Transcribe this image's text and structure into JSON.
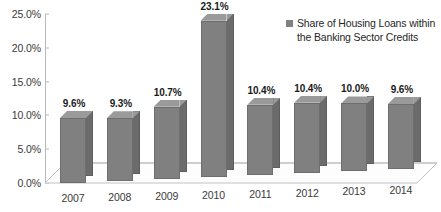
{
  "chart_data": {
    "type": "bar",
    "title": "",
    "xlabel": "",
    "ylabel": "",
    "categories": [
      "2007",
      "2008",
      "2009",
      "2010",
      "2011",
      "2012",
      "2013",
      "2014"
    ],
    "values": [
      9.6,
      9.3,
      10.7,
      23.1,
      10.4,
      10.4,
      10.0,
      9.6
    ],
    "value_labels": [
      "9.6%",
      "9.3%",
      "10.7%",
      "23.1%",
      "10.4%",
      "10.4%",
      "10.0%",
      "9.6%"
    ],
    "series": [
      {
        "name": "Share of Housing Loans within the Banking Sector Credits",
        "values": [
          9.6,
          9.3,
          10.7,
          23.1,
          10.4,
          10.4,
          10.0,
          9.6
        ],
        "color": "#808080"
      }
    ],
    "ylim": [
      0,
      25
    ],
    "ytick_values": [
      0,
      5,
      10,
      15,
      20,
      25
    ],
    "ytick_labels": [
      "0.0%",
      "5.0%",
      "10.0%",
      "15.0%",
      "20.0%",
      "25.0%"
    ],
    "grid": false,
    "legend_position": "top-right",
    "style": "3d-column"
  },
  "legend": {
    "marker": "legend-swatch",
    "label": "Share of Housing Loans within the Banking Sector Credits"
  },
  "colors": {
    "bar_front": "#808080",
    "bar_side": "#6b6b6b",
    "bar_top": "#9a9a9a",
    "axis": "#b8b8b8",
    "text": "#3a3a3a",
    "label_text": "#1a1a1a",
    "background": "#ffffff"
  }
}
